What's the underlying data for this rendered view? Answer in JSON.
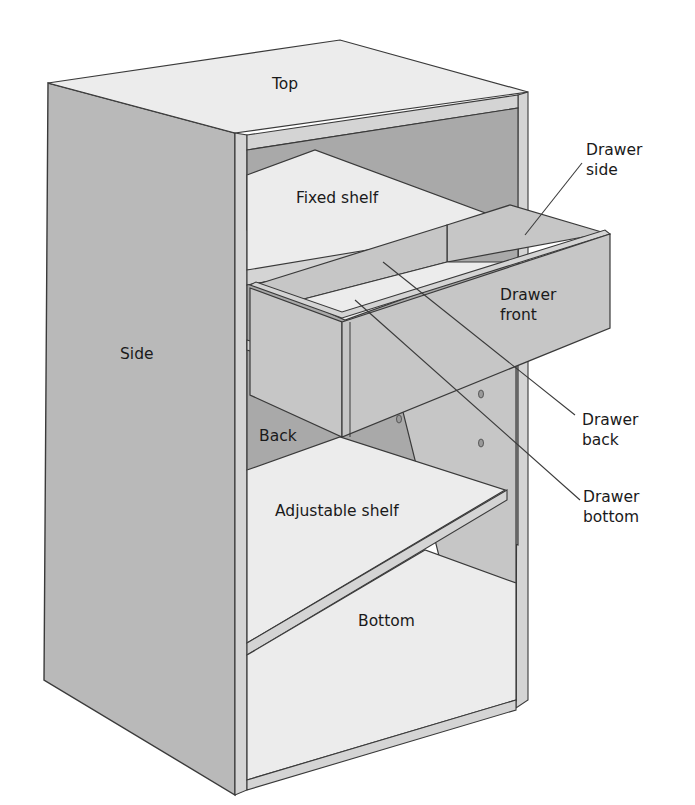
{
  "diagram": {
    "labels": {
      "top": "Top",
      "side": "Side",
      "fixed_shelf": "Fixed shelf",
      "back": "Back",
      "adjustable_shelf": "Adjustable shelf",
      "bottom": "Bottom",
      "drawer_front_line1": "Drawer",
      "drawer_front_line2": "front",
      "drawer_side_line1": "Drawer",
      "drawer_side_line2": "side",
      "drawer_back_line1": "Drawer",
      "drawer_back_line2": "back",
      "drawer_bottom_line1": "Drawer",
      "drawer_bottom_line2": "bottom"
    },
    "colors": {
      "side_panel": "#b9b9b9",
      "light_surface": "#ececec",
      "back_panel": "#a9a9a9",
      "outline": "#3a3a3a"
    }
  }
}
